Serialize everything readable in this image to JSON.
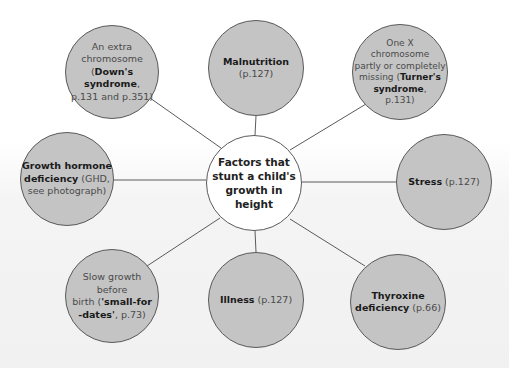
{
  "diagram": {
    "type": "spider-diagram",
    "colors": {
      "node_fill": "#c4c4c4",
      "center_fill": "#ffffff",
      "stroke": "#5a5a5a",
      "bold_text": "#1a1a1a",
      "normal_text": "#4a4a4a"
    },
    "center": {
      "label": "Factors that stunt a child's growth in height",
      "lines": [
        "Factors that",
        "stunt a child's",
        "growth in",
        "height"
      ]
    },
    "nodes": [
      {
        "id": "downs",
        "lines": [
          {
            "plain": "An extra"
          },
          {
            "plain": "chromosome"
          },
          {
            "pre": "(",
            "bold": "Down's syndrome",
            "post": ","
          },
          {
            "plain": "p.131 and p.351)"
          }
        ]
      },
      {
        "id": "malnutrition",
        "lines": [
          {
            "bold": "Malnutrition"
          },
          {
            "plain": "(p.127)"
          }
        ]
      },
      {
        "id": "turners",
        "lines": [
          {
            "plain": "One X"
          },
          {
            "plain": "chromosome"
          },
          {
            "plain": "partly or completely"
          },
          {
            "pre": "missing (",
            "bold": "Turner's"
          },
          {
            "bold": "syndrome",
            "post": ","
          },
          {
            "plain": "p.131)"
          }
        ]
      },
      {
        "id": "growth-hormone",
        "lines": [
          {
            "bold": "Growth hormone"
          },
          {
            "bold": "deficiency",
            "post": " (GHD,"
          },
          {
            "plain": "see photograph)"
          }
        ]
      },
      {
        "id": "stress",
        "lines": [
          {
            "bold": "Stress",
            "post": " (p.127)"
          }
        ]
      },
      {
        "id": "small-for-dates",
        "lines": [
          {
            "plain": "Slow growth"
          },
          {
            "plain": "before"
          },
          {
            "pre": "birth (",
            "bold": "'small-for"
          },
          {
            "bold": "-dates'",
            "post": ", p.73)"
          }
        ]
      },
      {
        "id": "illness",
        "lines": [
          {
            "bold": "Illness",
            "post": " (p.127)"
          }
        ]
      },
      {
        "id": "thyroxine",
        "lines": [
          {
            "bold": "Thyroxine"
          },
          {
            "bold": "deficiency",
            "post": " (p.66)"
          }
        ]
      }
    ]
  }
}
